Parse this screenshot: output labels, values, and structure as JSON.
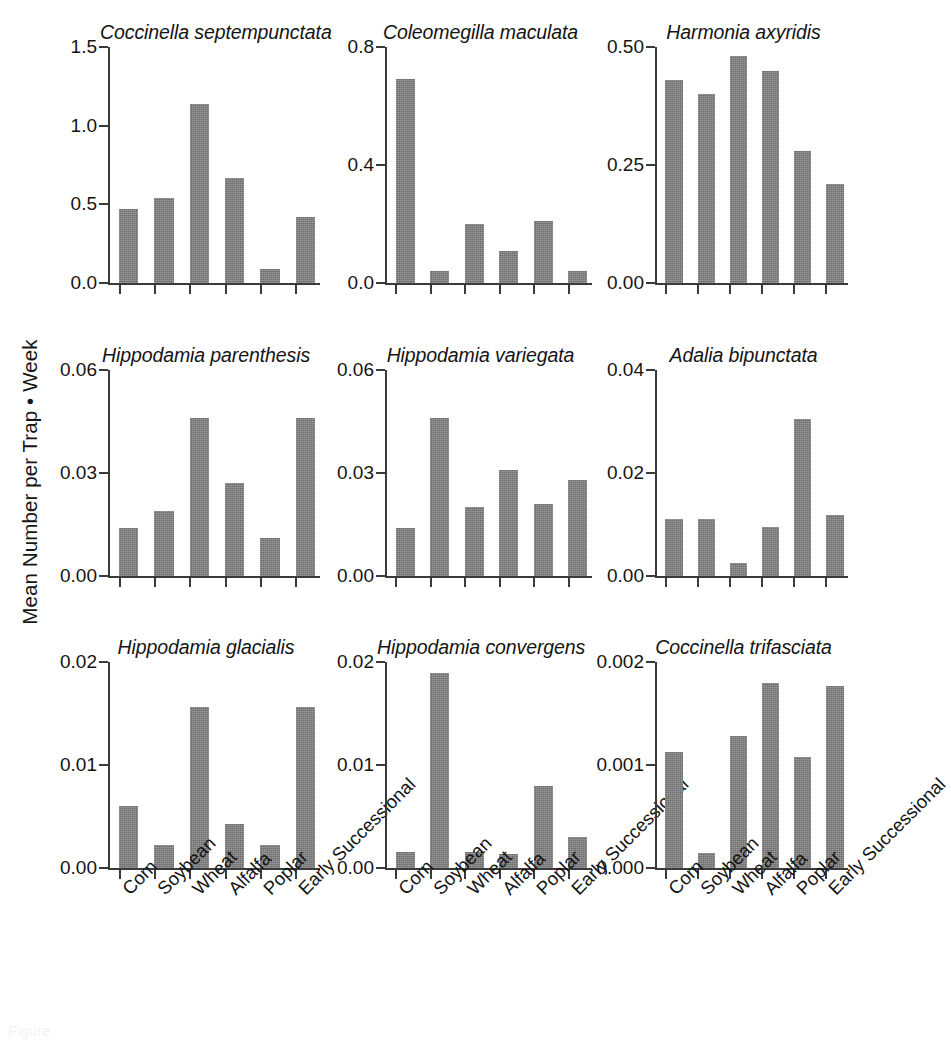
{
  "figure": {
    "ylabel": "Mean Number per Trap • Week",
    "bar_color": "#7b7b7b",
    "axis_color": "#3a3a3a",
    "background": "#ffffff",
    "caption_partial": "Figure"
  },
  "categories": [
    "Corn",
    "Soybean",
    "Wheat",
    "Alfalfa",
    "Poplar",
    "Early Successional"
  ],
  "chart_data": {
    "type": "bar",
    "title": "",
    "xlabel": "",
    "ylabel": "Mean Number per Trap • Week",
    "grid": false,
    "legend": "none",
    "layout": {
      "rows": 3,
      "cols": 3
    },
    "categories": [
      "Corn",
      "Soybean",
      "Wheat",
      "Alfalfa",
      "Poplar",
      "Early Successional"
    ],
    "panels": [
      {
        "title": "Coccinella septempunctata",
        "ylim": [
          0,
          1.5
        ],
        "yticks": [
          0,
          0.5,
          1.0,
          1.5
        ],
        "yticklabels": [
          "0.0",
          "0.5",
          "1.0",
          "1.5"
        ],
        "values": [
          0.47,
          0.54,
          1.14,
          0.67,
          0.09,
          0.42
        ]
      },
      {
        "title": "Coleomegilla maculata",
        "ylim": [
          0,
          0.8
        ],
        "yticks": [
          0,
          0.4,
          0.8
        ],
        "yticklabels": [
          "0.0",
          "0.4",
          "0.8"
        ],
        "values": [
          0.69,
          0.04,
          0.2,
          0.11,
          0.21,
          0.04
        ]
      },
      {
        "title": "Harmonia axyridis",
        "ylim": [
          0,
          0.5
        ],
        "yticks": [
          0,
          0.25,
          0.5
        ],
        "yticklabels": [
          "0.00",
          "0.25",
          "0.50"
        ],
        "values": [
          0.43,
          0.4,
          0.48,
          0.45,
          0.28,
          0.21
        ]
      },
      {
        "title": "Hippodamia parenthesis",
        "ylim": [
          0,
          0.06
        ],
        "yticks": [
          0,
          0.03,
          0.06
        ],
        "yticklabels": [
          "0.00",
          "0.03",
          "0.06"
        ],
        "values": [
          0.014,
          0.019,
          0.046,
          0.027,
          0.011,
          0.046
        ]
      },
      {
        "title": "Hippodamia variegata",
        "ylim": [
          0,
          0.06
        ],
        "yticks": [
          0,
          0.03,
          0.06
        ],
        "yticklabels": [
          "0.00",
          "0.03",
          "0.06"
        ],
        "values": [
          0.014,
          0.046,
          0.02,
          0.031,
          0.021,
          0.028
        ]
      },
      {
        "title": "Adalia bipunctata",
        "ylim": [
          0,
          0.04
        ],
        "yticks": [
          0,
          0.02,
          0.04
        ],
        "yticklabels": [
          "0.00",
          "0.02",
          "0.04"
        ],
        "values": [
          0.011,
          0.011,
          0.0025,
          0.0095,
          0.0305,
          0.0118
        ]
      },
      {
        "title": "Hippodamia glacialis",
        "ylim": [
          0,
          0.02
        ],
        "yticks": [
          0,
          0.01,
          0.02
        ],
        "yticklabels": [
          "0.00",
          "0.01",
          "0.02"
        ],
        "values": [
          0.006,
          0.0022,
          0.0156,
          0.0043,
          0.0022,
          0.0156
        ]
      },
      {
        "title": "Hippodamia convergens",
        "ylim": [
          0,
          0.02
        ],
        "yticks": [
          0,
          0.01,
          0.02
        ],
        "yticklabels": [
          "0.00",
          "0.01",
          "0.02"
        ],
        "values": [
          0.0016,
          0.0189,
          0.0016,
          0.0014,
          0.008,
          0.003
        ]
      },
      {
        "title": "Coccinella trifasciata",
        "ylim": [
          0,
          0.002
        ],
        "yticks": [
          0,
          0.001,
          0.002
        ],
        "yticklabels": [
          "0.000",
          "0.001",
          "0.002"
        ],
        "values": [
          0.00113,
          0.00015,
          0.00128,
          0.0018,
          0.00108,
          0.00177
        ]
      }
    ]
  }
}
